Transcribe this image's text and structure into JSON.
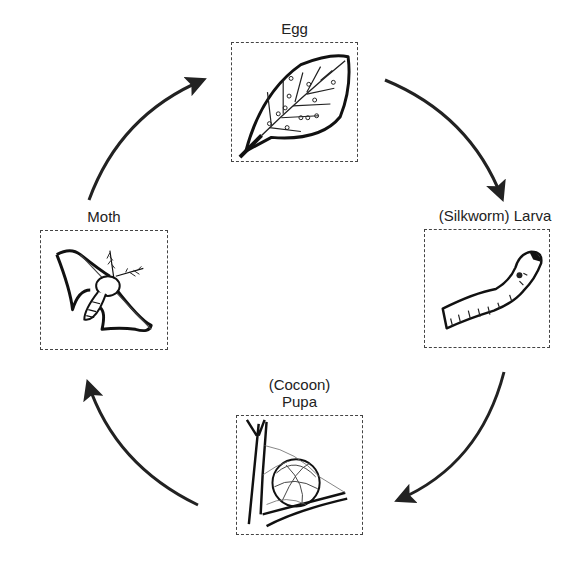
{
  "diagram": {
    "type": "cycle",
    "stages": [
      {
        "id": "egg",
        "label": "Egg",
        "illustration": "leaf-with-eggs"
      },
      {
        "id": "larva",
        "label": "(Silkworm) Larva",
        "illustration": "silkworm-caterpillar"
      },
      {
        "id": "pupa",
        "label_line1": "(Cocoon)",
        "label_line2": "Pupa",
        "illustration": "cocoon-on-twig"
      },
      {
        "id": "moth",
        "label": "Moth",
        "illustration": "silk-moth"
      }
    ],
    "edges": [
      {
        "from": "egg",
        "to": "larva"
      },
      {
        "from": "larva",
        "to": "pupa"
      },
      {
        "from": "pupa",
        "to": "moth"
      },
      {
        "from": "moth",
        "to": "egg"
      }
    ],
    "colors": {
      "line": "#222222",
      "box_border": "#444444",
      "background": "#ffffff"
    }
  }
}
